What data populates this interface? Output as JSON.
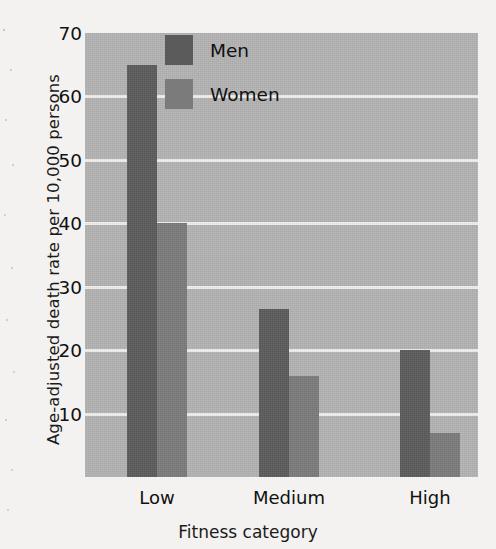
{
  "chart_data": {
    "type": "bar",
    "title": "",
    "categories": [
      "Low",
      "Medium",
      "High"
    ],
    "series": [
      {
        "name": "Men",
        "color": "#5b5b5b",
        "values": [
          65,
          26.5,
          20
        ]
      },
      {
        "name": "Women",
        "color": "#7b7b7b",
        "values": [
          40,
          16,
          7
        ]
      }
    ],
    "xlabel": "Fitness category",
    "ylabel": "Age-adjusted death rate per 10,000 persons",
    "ylim": [
      0,
      70
    ],
    "ytick_labels": [
      "70",
      "60",
      "50",
      "40",
      "30",
      "20",
      "10"
    ],
    "ytick_values": [
      70,
      60,
      50,
      40,
      30,
      20,
      10
    ],
    "grid": true,
    "grid_color": "#f0efec",
    "plot_background": "#b3b3b3",
    "legend_position": "upper-center-inside",
    "legend_entries": [
      "Men",
      "Women"
    ]
  }
}
